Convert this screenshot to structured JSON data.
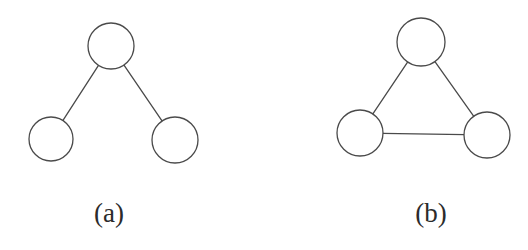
{
  "figure": {
    "background_color": "#ffffff",
    "stroke_color": "#4a4a4a",
    "label_color": "#2b2b2b",
    "stroke_width": 1.3,
    "width": 528,
    "height": 250,
    "panels": [
      {
        "id": "panel-a",
        "label": "(a)",
        "label_x": 109,
        "label_y": 200,
        "graph_type": "tree",
        "node_count": 3,
        "edge_count": 2,
        "nodes": [
          {
            "id": "a-top",
            "name": "node-top",
            "cx": 111,
            "cy": 46,
            "r": 23
          },
          {
            "id": "a-bottom-left",
            "name": "node-bottom-left",
            "cx": 51,
            "cy": 139,
            "r": 22
          },
          {
            "id": "a-bottom-right",
            "name": "node-bottom-right",
            "cx": 175,
            "cy": 140,
            "r": 23
          }
        ],
        "edges": [
          {
            "id": "a-edge-top-left",
            "name": "edge-top-to-bottom-left",
            "from": "a-top",
            "to": "a-bottom-left"
          },
          {
            "id": "a-edge-top-right",
            "name": "edge-top-to-bottom-right",
            "from": "a-top",
            "to": "a-bottom-right"
          }
        ]
      },
      {
        "id": "panel-b",
        "label": "(b)",
        "label_x": 431,
        "label_y": 200,
        "graph_type": "triangle-cycle",
        "node_count": 3,
        "edge_count": 3,
        "nodes": [
          {
            "id": "b-top",
            "name": "node-top",
            "cx": 421,
            "cy": 42,
            "r": 24
          },
          {
            "id": "b-bottom-left",
            "name": "node-bottom-left",
            "cx": 360,
            "cy": 133,
            "r": 23
          },
          {
            "id": "b-bottom-right",
            "name": "node-bottom-right",
            "cx": 487,
            "cy": 135,
            "r": 23
          }
        ],
        "edges": [
          {
            "id": "b-edge-top-left",
            "name": "edge-top-to-bottom-left",
            "from": "b-top",
            "to": "b-bottom-left"
          },
          {
            "id": "b-edge-top-right",
            "name": "edge-top-to-bottom-right",
            "from": "b-top",
            "to": "b-bottom-right"
          },
          {
            "id": "b-edge-bottom",
            "name": "edge-bottom-left-to-bottom-right",
            "from": "b-bottom-left",
            "to": "b-bottom-right"
          }
        ]
      }
    ]
  }
}
